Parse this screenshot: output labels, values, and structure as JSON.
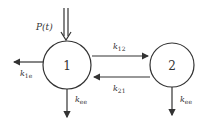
{
  "diagram": {
    "type": "two-compartment model",
    "input": {
      "label": "P(t)",
      "label_main": "P",
      "label_arg": "(t)"
    },
    "compartments": [
      {
        "id": "1",
        "label": "1"
      },
      {
        "id": "2",
        "label": "2"
      }
    ],
    "rates": {
      "k12": {
        "base": "k",
        "sub": "12"
      },
      "k21": {
        "base": "k",
        "sub": "21"
      },
      "k1e": {
        "base": "k",
        "sub": "1e"
      },
      "kee1": {
        "base": "k",
        "sub": "ee"
      },
      "kee2": {
        "base": "k",
        "sub": "ee"
      }
    },
    "colors": {
      "stroke": "#333333",
      "background": "#ffffff"
    }
  }
}
